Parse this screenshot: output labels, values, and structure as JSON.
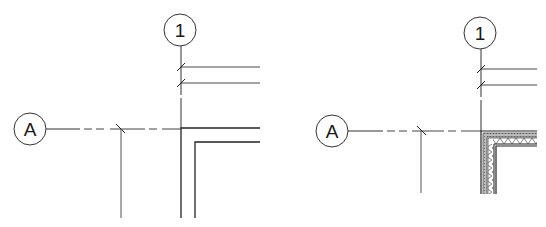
{
  "panels": [
    {
      "id": "left",
      "description": "Wall corner with grid lines - simple wall representation",
      "grid_bubbles": {
        "vertical": {
          "label": "1"
        },
        "horizontal": {
          "label": "A"
        }
      },
      "wall_style": "two-line"
    },
    {
      "id": "right",
      "description": "Wall corner with grid lines - layered wall representation with insulation hatch",
      "grid_bubbles": {
        "vertical": {
          "label": "1"
        },
        "horizontal": {
          "label": "A"
        }
      },
      "wall_style": "layered-with-insulation"
    }
  ],
  "colors": {
    "line": "#2a2a2a",
    "light_line": "#555555",
    "background": "#ffffff"
  }
}
